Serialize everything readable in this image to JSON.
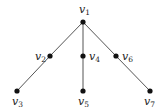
{
  "diagram": {
    "type": "tree",
    "nodes": [
      {
        "id": "v1",
        "label": "v",
        "sub": "1",
        "x": 83,
        "y": 22,
        "lx": 79,
        "ly": 13
      },
      {
        "id": "v2",
        "label": "v",
        "sub": "2",
        "x": 50,
        "y": 56,
        "lx": 35,
        "ly": 60
      },
      {
        "id": "v3",
        "label": "v",
        "sub": "3",
        "x": 17,
        "y": 91,
        "lx": 12,
        "ly": 105
      },
      {
        "id": "v4",
        "label": "v",
        "sub": "4",
        "x": 83,
        "y": 56,
        "lx": 89,
        "ly": 60
      },
      {
        "id": "v5",
        "label": "v",
        "sub": "5",
        "x": 83,
        "y": 91,
        "lx": 78,
        "ly": 105
      },
      {
        "id": "v6",
        "label": "v",
        "sub": "6",
        "x": 116,
        "y": 56,
        "lx": 122,
        "ly": 60
      },
      {
        "id": "v7",
        "label": "v",
        "sub": "7",
        "x": 150,
        "y": 91,
        "lx": 144,
        "ly": 105
      }
    ],
    "edges": [
      [
        "v1",
        "v2"
      ],
      [
        "v2",
        "v3"
      ],
      [
        "v1",
        "v4"
      ],
      [
        "v4",
        "v5"
      ],
      [
        "v1",
        "v6"
      ],
      [
        "v6",
        "v7"
      ]
    ],
    "colors": {
      "edge": "#555555",
      "node": "#111111",
      "label": "#222222"
    }
  }
}
